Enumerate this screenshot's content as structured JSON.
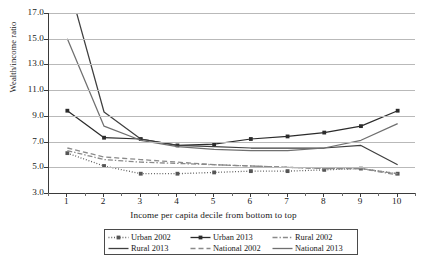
{
  "chart_data": {
    "type": "line",
    "title": "",
    "xlabel": "Income per capita decile from bottom to top",
    "ylabel": "Wealth/income ratio",
    "x": [
      1,
      2,
      3,
      4,
      5,
      6,
      7,
      8,
      9,
      10
    ],
    "xtick_labels": [
      "1",
      "2",
      "3",
      "4",
      "5",
      "6",
      "7",
      "8",
      "9",
      "10"
    ],
    "ytick_labels": [
      "3.0",
      "5.0",
      "7.0",
      "9.0",
      "11.0",
      "13.0",
      "15.0",
      "17.0"
    ],
    "yticks": [
      3.0,
      5.0,
      7.0,
      9.0,
      11.0,
      13.0,
      15.0,
      17.0
    ],
    "ylim": [
      3.0,
      17.0
    ],
    "grid": "horizontal",
    "legend_position": "below-axes",
    "series": [
      {
        "name": "Urban 2002",
        "style": "dotted",
        "marker": "square",
        "color": "#555555",
        "values": [
          6.1,
          5.1,
          4.5,
          4.5,
          4.6,
          4.7,
          4.7,
          4.8,
          4.9,
          4.5
        ]
      },
      {
        "name": "Urban 2013",
        "style": "solid",
        "marker": "square",
        "color": "#2b2b2b",
        "values": [
          9.4,
          7.3,
          7.2,
          6.7,
          6.8,
          7.2,
          7.4,
          7.7,
          8.2,
          9.4
        ]
      },
      {
        "name": "Rural 2002",
        "style": "dashdot",
        "marker": "none",
        "color": "#8a8a8a",
        "values": [
          6.3,
          5.6,
          5.4,
          5.3,
          5.2,
          5.1,
          5.0,
          4.9,
          4.9,
          4.4
        ]
      },
      {
        "name": "Rural 2013",
        "style": "solid",
        "marker": "none",
        "color": "#3f3f3f",
        "values": [
          19.6,
          9.3,
          7.2,
          6.7,
          6.6,
          6.5,
          6.5,
          6.5,
          6.7,
          5.2
        ]
      },
      {
        "name": "National 2002",
        "style": "dashed",
        "marker": "none",
        "color": "#8a8a8a",
        "values": [
          6.5,
          5.8,
          5.6,
          5.4,
          5.2,
          5.1,
          5.0,
          4.9,
          4.9,
          4.5
        ]
      },
      {
        "name": "National 2013",
        "style": "solid",
        "marker": "none",
        "color": "#6f6f6f",
        "values": [
          15.0,
          8.2,
          7.1,
          6.6,
          6.4,
          6.3,
          6.3,
          6.5,
          7.1,
          8.4
        ]
      }
    ]
  }
}
